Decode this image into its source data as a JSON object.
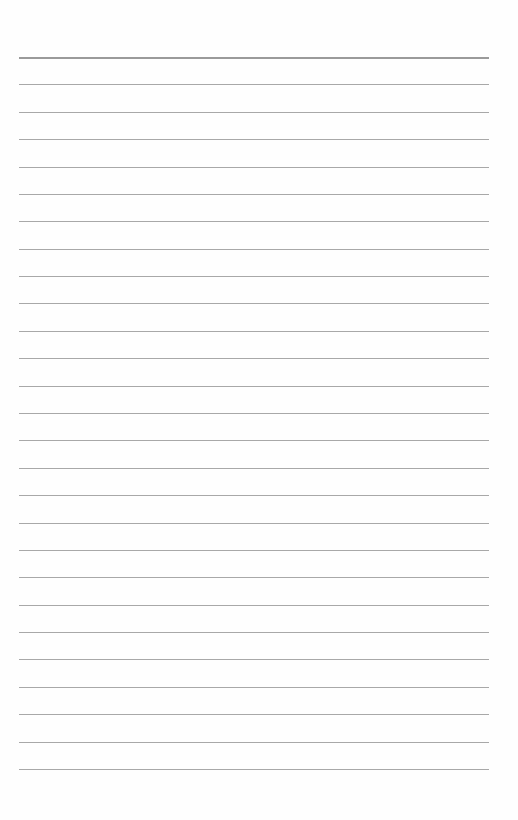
{
  "page": {
    "type": "lined-paper",
    "background_color": "#fefefe",
    "line_color": "#a8a8a8",
    "first_line_color": "#9a9a9a",
    "line_count": 27,
    "first_line_y": 57,
    "last_line_y": 769,
    "line_left_x": 19,
    "line_right_x": 489,
    "text": ""
  }
}
